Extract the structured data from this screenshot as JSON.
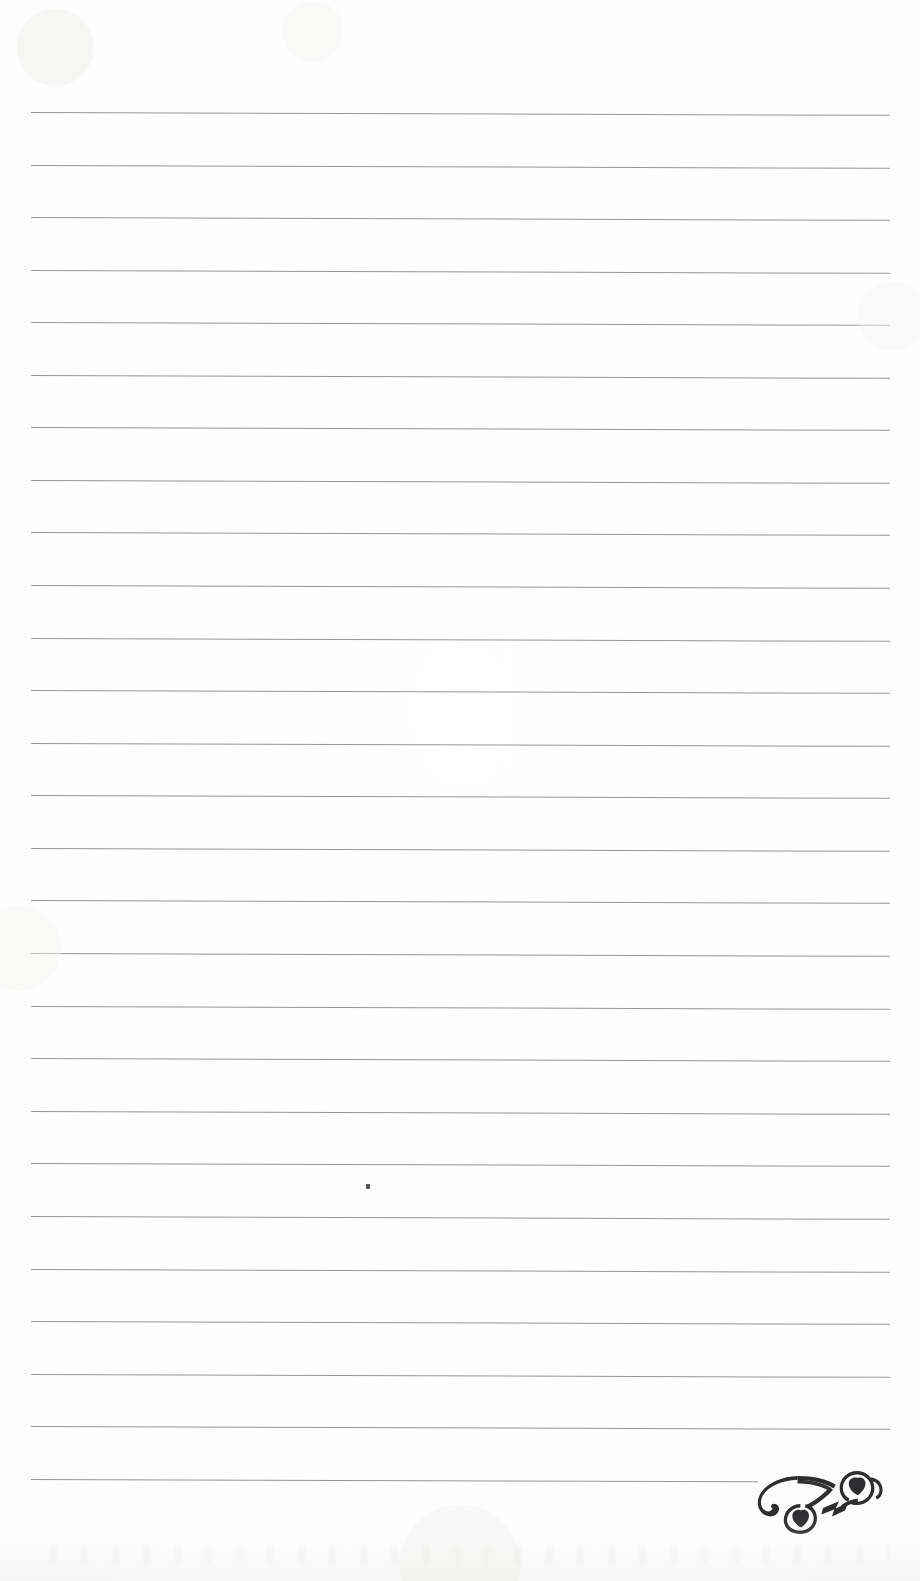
{
  "document": {
    "kind": "lined-journal-page",
    "title": "Blank Ruled Notebook Page",
    "page_width": 920,
    "page_height": 1581,
    "background_color": "#fefefe",
    "rule_color": "#8d8d90",
    "ink_color": "#2e2e30",
    "text_content": "",
    "visible_text": ""
  },
  "ruling": {
    "line_count": 27,
    "first_line_y": 112,
    "line_spacing": 52.6,
    "left_margin_x": 31,
    "right_margin_x": 890,
    "slope_px_over_width": 3,
    "stroke_width_px": 1,
    "note": "ruled writing lines, slightly tilted from scan"
  },
  "lines": [
    {
      "index": 1,
      "y": 112,
      "x_start": 31,
      "x_end": 890,
      "full_width": true
    },
    {
      "index": 2,
      "y": 165,
      "x_start": 31,
      "x_end": 890,
      "full_width": true
    },
    {
      "index": 3,
      "y": 217,
      "x_start": 31,
      "x_end": 890,
      "full_width": true
    },
    {
      "index": 4,
      "y": 270,
      "x_start": 31,
      "x_end": 890,
      "full_width": true
    },
    {
      "index": 5,
      "y": 322,
      "x_start": 31,
      "x_end": 890,
      "full_width": true
    },
    {
      "index": 6,
      "y": 375,
      "x_start": 31,
      "x_end": 890,
      "full_width": true
    },
    {
      "index": 7,
      "y": 427,
      "x_start": 31,
      "x_end": 890,
      "full_width": true
    },
    {
      "index": 8,
      "y": 480,
      "x_start": 31,
      "x_end": 890,
      "full_width": true
    },
    {
      "index": 9,
      "y": 532,
      "x_start": 31,
      "x_end": 890,
      "full_width": true
    },
    {
      "index": 10,
      "y": 585,
      "x_start": 31,
      "x_end": 890,
      "full_width": true
    },
    {
      "index": 11,
      "y": 638,
      "x_start": 31,
      "x_end": 890,
      "full_width": true
    },
    {
      "index": 12,
      "y": 690,
      "x_start": 31,
      "x_end": 890,
      "full_width": true
    },
    {
      "index": 13,
      "y": 743,
      "x_start": 31,
      "x_end": 890,
      "full_width": true
    },
    {
      "index": 14,
      "y": 795,
      "x_start": 31,
      "x_end": 890,
      "full_width": true
    },
    {
      "index": 15,
      "y": 848,
      "x_start": 31,
      "x_end": 890,
      "full_width": true
    },
    {
      "index": 16,
      "y": 900,
      "x_start": 31,
      "x_end": 890,
      "full_width": true
    },
    {
      "index": 17,
      "y": 953,
      "x_start": 31,
      "x_end": 890,
      "full_width": true
    },
    {
      "index": 18,
      "y": 1006,
      "x_start": 31,
      "x_end": 890,
      "full_width": true
    },
    {
      "index": 19,
      "y": 1058,
      "x_start": 31,
      "x_end": 890,
      "full_width": true
    },
    {
      "index": 20,
      "y": 1111,
      "x_start": 31,
      "x_end": 890,
      "full_width": true
    },
    {
      "index": 21,
      "y": 1163,
      "x_start": 31,
      "x_end": 890,
      "full_width": true
    },
    {
      "index": 22,
      "y": 1216,
      "x_start": 31,
      "x_end": 890,
      "full_width": true
    },
    {
      "index": 23,
      "y": 1269,
      "x_start": 31,
      "x_end": 890,
      "full_width": true
    },
    {
      "index": 24,
      "y": 1321,
      "x_start": 31,
      "x_end": 890,
      "full_width": true
    },
    {
      "index": 25,
      "y": 1374,
      "x_start": 31,
      "x_end": 890,
      "full_width": true
    },
    {
      "index": 26,
      "y": 1426,
      "x_start": 31,
      "x_end": 890,
      "full_width": true
    },
    {
      "index": 27,
      "y": 1479,
      "x_start": 31,
      "x_end": 758,
      "full_width": false
    }
  ],
  "ornament": {
    "name": "corner-flourish",
    "description": "scrollwork filigree with two heart-shaped leaf terminals",
    "x": 753,
    "y": 1468,
    "width": 135,
    "height": 66,
    "color": "#2e2e30",
    "position": "bottom-right"
  },
  "artifacts": {
    "speck": {
      "x": 366,
      "y": 1184,
      "width": 4,
      "height": 5,
      "color": "#3a3a3c"
    }
  }
}
